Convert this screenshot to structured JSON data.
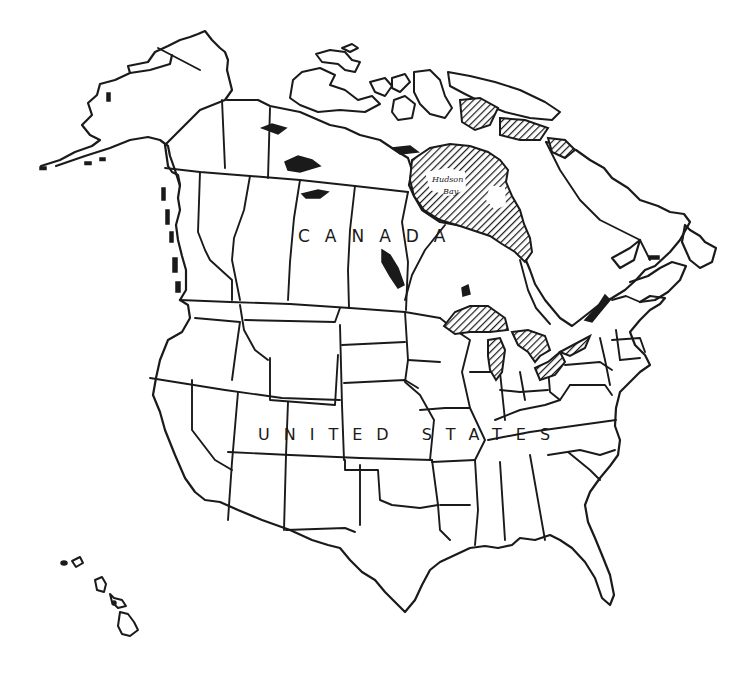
{
  "map": {
    "title": "Outline map of North America",
    "style": "hand-drawn black ink outline, hatched water bodies",
    "labels": {
      "canada": "CANADA",
      "united_states": "UNITED STATES",
      "hudson_bay": "Hudson",
      "hudson_bay_2": "Bay"
    },
    "regions": [
      "Alaska",
      "Canada",
      "Arctic Archipelago",
      "Hudson Bay",
      "Great Lakes",
      "United States",
      "Hawaii"
    ],
    "colors": {
      "ink": "#1a1a1a",
      "paper": "#ffffff"
    }
  }
}
